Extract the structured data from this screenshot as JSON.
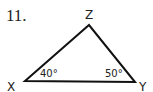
{
  "problem": {
    "number": "11."
  },
  "triangle": {
    "vertices": [
      {
        "name": "X",
        "x": 25,
        "y": 81
      },
      {
        "name": "Z",
        "x": 89,
        "y": 25
      },
      {
        "name": "Y",
        "x": 135,
        "y": 82
      }
    ],
    "labels": {
      "x": "X",
      "y": "Y",
      "z": "Z"
    },
    "angles": {
      "x": "40°",
      "y": "50°"
    },
    "stroke_color": "#111111"
  }
}
